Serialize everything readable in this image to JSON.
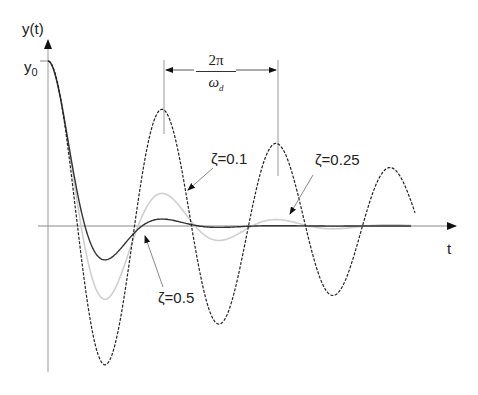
{
  "chart_data": {
    "type": "line",
    "title": "",
    "xlabel": "t",
    "ylabel": "y(t)",
    "y_tick_labels": [
      "y0"
    ],
    "grid": false,
    "legend": "annotations with arrows",
    "annotations": {
      "period_label_numerator": "2π",
      "period_label_denominator": "ωd",
      "zeta_01": "ζ=0.1",
      "zeta_025": "ζ=0.25",
      "zeta_05": "ζ=0.5"
    },
    "series": [
      {
        "name": "ζ=0.1",
        "style": "dashed",
        "color": "#222222",
        "zeta": 0.1,
        "extrema_relative_to_y0": [
          1.0,
          -0.72,
          0.55,
          -0.38,
          0.29,
          -0.2,
          0.17
        ]
      },
      {
        "name": "ζ=0.25",
        "style": "solid",
        "color": "#c8c8c8",
        "zeta": 0.25,
        "extrema_relative_to_y0": [
          1.0,
          -0.44,
          0.22,
          -0.09,
          0.05,
          -0.02
        ]
      },
      {
        "name": "ζ=0.5",
        "style": "solid",
        "color": "#333333",
        "zeta": 0.5,
        "extrema_relative_to_y0": [
          1.0,
          -0.16,
          0.04,
          -0.01
        ]
      }
    ]
  },
  "labels": {
    "y_axis": "y(t)",
    "x_axis": "t",
    "y0_main": "y",
    "y0_sub": "0",
    "period_num": "2π",
    "period_den": "ω",
    "period_den_sub": "d",
    "zeta_01": "ζ=0.1",
    "zeta_025": "ζ=0.25",
    "zeta_05": "ζ=0.5"
  },
  "geometry": {
    "origin_x": 48,
    "axis_y": 226,
    "y0_px": 61,
    "period_px": 114,
    "t_end_px": 455
  }
}
